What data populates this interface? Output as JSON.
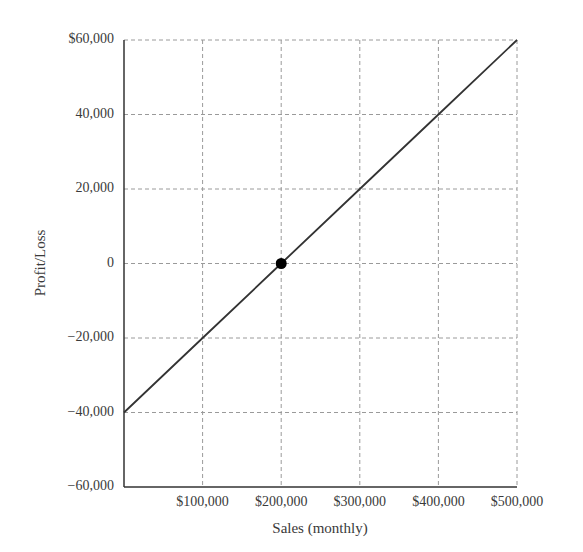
{
  "chart_data": {
    "type": "line",
    "title": "",
    "xlabel": "Sales (monthly)",
    "ylabel": "Profit/Loss",
    "x_tick_labels": [
      "$100,000",
      "$200,000",
      "$300,000",
      "$400,000",
      "$500,000"
    ],
    "x_ticks": [
      100000,
      200000,
      300000,
      400000,
      500000
    ],
    "y_tick_labels": [
      "$60,000",
      "40,000",
      "20,000",
      "0",
      "−20,000",
      "−40,000",
      "−60,000"
    ],
    "y_ticks": [
      60000,
      40000,
      20000,
      0,
      -20000,
      -40000,
      -60000
    ],
    "xlim": [
      0,
      500000
    ],
    "ylim": [
      -60000,
      60000
    ],
    "grid": true,
    "grid_style": "dashed",
    "legend": null,
    "series": [
      {
        "name": "Profit/Loss",
        "x": [
          0,
          100000,
          200000,
          300000,
          400000,
          500000
        ],
        "y": [
          -40000,
          -20000,
          0,
          20000,
          40000,
          60000
        ],
        "color": "#333333"
      }
    ],
    "annotations": [
      {
        "type": "point",
        "label": "break-even",
        "x": 200000,
        "y": 0,
        "color": "#000000"
      }
    ]
  }
}
